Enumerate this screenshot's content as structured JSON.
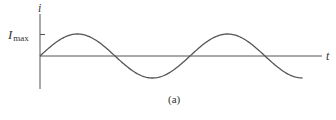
{
  "figure": {
    "caption": "(a)",
    "y_axis_label": "i",
    "x_axis_label": "t",
    "y_tick_label_main": "I",
    "y_tick_label_sub": "max"
  },
  "colors": {
    "curve": "#555555",
    "axis": "#555555",
    "text": "#333333",
    "background": "#ffffff"
  },
  "chart_data": {
    "type": "line",
    "title": "",
    "xlabel": "t",
    "ylabel": "i",
    "y_ticks": [
      "I_max"
    ],
    "x": [
      0,
      0.25,
      0.5,
      0.75,
      1.0,
      1.25,
      1.5,
      1.75
    ],
    "series": [
      {
        "name": "i(t)",
        "values": [
          0,
          1,
          0,
          -1,
          0,
          1,
          0,
          -1
        ]
      }
    ],
    "ylim": [
      -1,
      1
    ],
    "grid": false,
    "legend": "none"
  }
}
